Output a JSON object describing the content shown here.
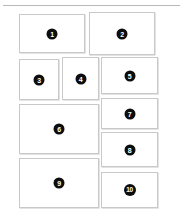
{
  "page": {
    "background_color": "#ffffff",
    "width": 187,
    "height": 220,
    "divider_color": "#b9b9b9"
  },
  "style": {
    "block_border_color": "#c9c9c9",
    "block_fill_color": "#ffffff",
    "badge_background_color": "#0d0d0d",
    "badge_text_color": "#ffffff"
  },
  "blocks": [
    {
      "label": "1",
      "x": 19,
      "y": 14,
      "w": 66,
      "h": 39
    },
    {
      "label": "2",
      "x": 89,
      "y": 12,
      "w": 66,
      "h": 43
    },
    {
      "label": "3",
      "x": 19,
      "y": 59,
      "w": 40,
      "h": 41
    },
    {
      "label": "4",
      "x": 62,
      "y": 57,
      "w": 37,
      "h": 43
    },
    {
      "label": "5",
      "x": 101,
      "y": 57,
      "w": 57,
      "h": 37
    },
    {
      "label": "6",
      "x": 19,
      "y": 104,
      "w": 80,
      "h": 50
    },
    {
      "label": "7",
      "x": 101,
      "y": 98,
      "w": 57,
      "h": 31
    },
    {
      "label": "8",
      "x": 101,
      "y": 132,
      "w": 57,
      "h": 35
    },
    {
      "label": "9",
      "x": 19,
      "y": 158,
      "w": 80,
      "h": 50
    },
    {
      "label": "10",
      "x": 101,
      "y": 172,
      "w": 57,
      "h": 36
    }
  ]
}
